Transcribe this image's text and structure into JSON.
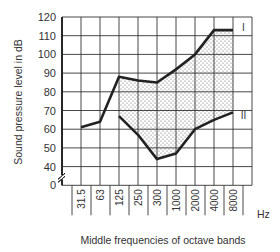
{
  "chart_data": {
    "type": "line",
    "title": "",
    "xlabel": "Middle frequencies of octave bands",
    "ylabel": "Sound pressure level in dB",
    "x_unit": "Hz",
    "categories": [
      "31.5",
      "63",
      "125",
      "250",
      "300",
      "1000",
      "2000",
      "4000",
      "8000"
    ],
    "y_ticks": [
      "0",
      "40",
      "50",
      "60",
      "70",
      "80",
      "90",
      "100",
      "110",
      "120"
    ],
    "ylim": [
      0,
      120
    ],
    "y_axis_break": true,
    "grid": true,
    "series": [
      {
        "name": "I",
        "values": [
          61,
          64,
          88,
          86,
          85,
          92,
          100,
          113,
          113
        ]
      },
      {
        "name": "II",
        "values": [
          null,
          null,
          67,
          57,
          44,
          47,
          60,
          65,
          69
        ]
      }
    ],
    "shaded_region": "Area between curve I and curve II from 125 Hz to 8000 Hz (dotted fill)"
  },
  "colors": {
    "line": "#222222",
    "grid": "#333333",
    "fill_dots": "#555555",
    "background": "#ffffff"
  }
}
